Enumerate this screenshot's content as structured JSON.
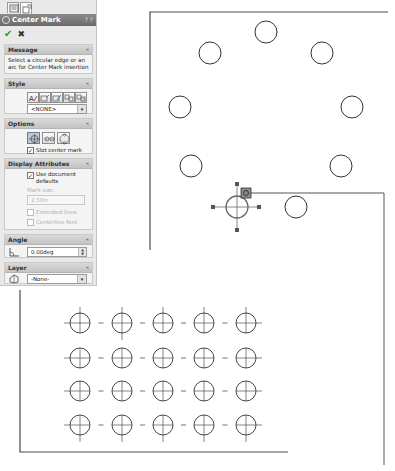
{
  "property_manager": {
    "tabs": [
      {
        "name": "property-manager-tab",
        "active": false
      },
      {
        "name": "configuration-tab",
        "active": true
      }
    ],
    "title": "Center Mark",
    "help_glyphs": "? ?",
    "ok_label": "✔",
    "cancel_label": "✖",
    "groups": {
      "message": {
        "header": "Message",
        "text": "Select a circular edge or an arc for Center Mark insertion"
      },
      "style": {
        "header": "Style",
        "buttons": [
          "style-1",
          "style-2",
          "style-3",
          "style-4",
          "style-5"
        ],
        "select_value": "<NONE>"
      },
      "options": {
        "header": "Options",
        "buttons": [
          "single-center-mark",
          "linear-center-mark",
          "circular-center-mark"
        ],
        "slot_label": "Slot center mark",
        "slot_checked": true
      },
      "display_attributes": {
        "header": "Display Attributes",
        "use_defaults_label": "Use document defaults",
        "use_defaults_checked": true,
        "mark_size_label": "Mark size:",
        "mark_size_value": "2.50in",
        "extended_lines_label": "Extended lines",
        "centerline_font_label": "Centerline font"
      },
      "angle": {
        "header": "Angle",
        "value": "0.00deg"
      },
      "layer": {
        "header": "Layer",
        "value": "-None-"
      }
    },
    "collapse_glyph": "«"
  },
  "drawing": {
    "line_color": "#3a3a3a",
    "selection_color": "#6a6a6a",
    "bolt_circle_holes": [
      {
        "cx": 266,
        "cy": 32
      },
      {
        "cx": 210,
        "cy": 53
      },
      {
        "cx": 322,
        "cy": 53
      },
      {
        "cx": 180,
        "cy": 107
      },
      {
        "cx": 352,
        "cy": 107
      },
      {
        "cx": 191,
        "cy": 166
      },
      {
        "cx": 341,
        "cy": 166
      },
      {
        "cx": 296,
        "cy": 207
      }
    ],
    "hole_radius": 11,
    "selected_hole": {
      "cx": 237,
      "cy": 207,
      "r": 11
    },
    "grid": {
      "columns_x": [
        80,
        122,
        163,
        204,
        246
      ],
      "rows_y": [
        323,
        358,
        391,
        425
      ],
      "radius": 10
    }
  }
}
